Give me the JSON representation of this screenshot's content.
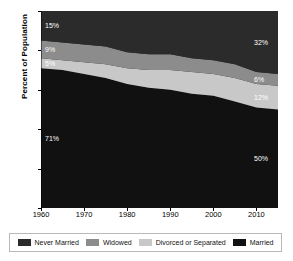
{
  "chart_data": {
    "type": "area",
    "stacked": true,
    "title": "",
    "xlabel": "",
    "ylabel": "Percent of Population",
    "xlim": [
      1960,
      2015
    ],
    "ylim": [
      0,
      100
    ],
    "grid": false,
    "legend_position": "bottom",
    "x_ticks": [
      "1960",
      "1970",
      "1980",
      "1990",
      "2000",
      "2010"
    ],
    "x_tick_values": [
      1960,
      1970,
      1980,
      1990,
      2000,
      2010
    ],
    "y_ticks": [
      "0",
      "20",
      "40",
      "60",
      "80",
      "100"
    ],
    "y_tick_values": [
      0,
      20,
      40,
      60,
      80,
      100
    ],
    "x": [
      1960,
      1965,
      1970,
      1975,
      1980,
      1985,
      1990,
      1995,
      2000,
      2005,
      2010,
      2015
    ],
    "series": [
      {
        "name": "Married",
        "color": "#111111",
        "values": [
          71,
          70,
          68,
          66,
          63,
          61,
          60,
          58,
          57,
          54,
          51,
          50
        ],
        "start_label": "71%",
        "end_label": "50%"
      },
      {
        "name": "Divorced or Separated",
        "color": "#c8c8c8",
        "values": [
          5,
          5,
          6,
          7,
          8,
          9,
          10,
          11,
          11,
          12,
          12,
          12
        ],
        "start_label": "5%",
        "end_label": "12%"
      },
      {
        "name": "Widowed",
        "color": "#8c8c8c",
        "values": [
          9,
          9,
          9,
          9,
          8,
          8,
          8,
          7,
          7,
          7,
          6,
          6
        ],
        "start_label": "9%",
        "end_label": "6%"
      },
      {
        "name": "Never Married",
        "color": "#2b2b2b",
        "values": [
          15,
          16,
          17,
          18,
          21,
          22,
          22,
          24,
          25,
          27,
          31,
          32
        ],
        "start_label": "15%",
        "end_label": "32%"
      }
    ]
  },
  "legend": {
    "items": [
      {
        "label": "Never Married",
        "color": "#2b2b2b"
      },
      {
        "label": "Widowed",
        "color": "#8c8c8c"
      },
      {
        "label": "Divorced or Separated",
        "color": "#c8c8c8"
      },
      {
        "label": "Married",
        "color": "#111111"
      }
    ]
  },
  "axis": {
    "y_title": "Percent of Population"
  },
  "labels": {
    "left": [
      {
        "text": "15%",
        "series": "Never Married"
      },
      {
        "text": "9%",
        "series": "Widowed"
      },
      {
        "text": "5%",
        "series": "Divorced or Separated"
      },
      {
        "text": "71%",
        "series": "Married"
      }
    ],
    "right": [
      {
        "text": "32%",
        "series": "Never Married"
      },
      {
        "text": "6%",
        "series": "Widowed"
      },
      {
        "text": "12%",
        "series": "Divorced or Separated"
      },
      {
        "text": "50%",
        "series": "Married"
      }
    ]
  }
}
